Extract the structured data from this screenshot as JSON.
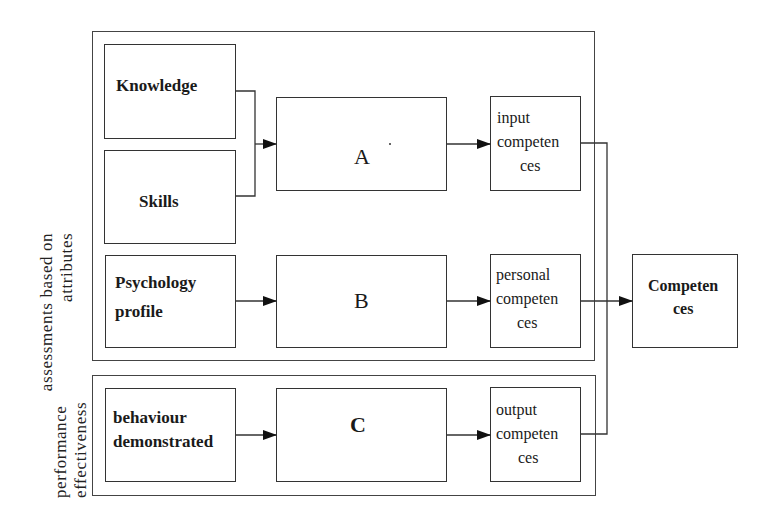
{
  "diagram": {
    "side_labels": {
      "attributes": {
        "line1": "assessments based on",
        "line2": "attributes"
      },
      "performance": {
        "line1": "performance",
        "line2": "effectiveness"
      }
    },
    "inputs": {
      "knowledge": "Knowledge",
      "skills": "Skills",
      "psychology_line1": "Psychology",
      "psychology_line2": "profile",
      "behaviour_line1": "behaviour",
      "behaviour_line2": "demonstrated"
    },
    "processes": {
      "a": "A",
      "b": "B",
      "c": "C"
    },
    "competences": {
      "input": {
        "line1": "input",
        "line2": "competen",
        "line3": "ces"
      },
      "personal": {
        "line1": "personal",
        "line2": "competen",
        "line3": "ces"
      },
      "output": {
        "line1": "output",
        "line2": "competen",
        "line3": "ces"
      }
    },
    "result": {
      "line1": "Competen",
      "line2": "ces"
    }
  }
}
